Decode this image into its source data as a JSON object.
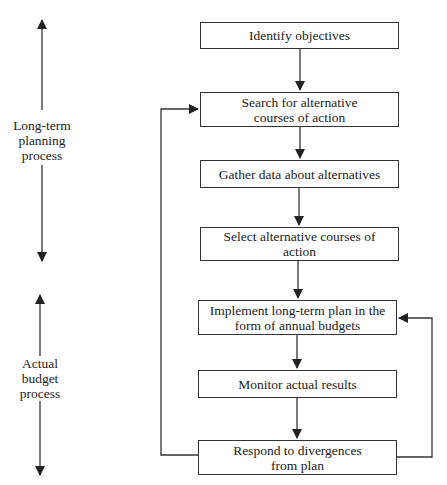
{
  "diagram": {
    "type": "flowchart",
    "side_labels": {
      "long_term": [
        "Long-term",
        "planning",
        "process"
      ],
      "actual_budget": [
        "Actual",
        "budget",
        "process"
      ]
    },
    "steps": [
      {
        "id": "identify",
        "text": "Identify objectives"
      },
      {
        "id": "search",
        "text": "Search for alternative courses of action"
      },
      {
        "id": "gather",
        "text": "Gather data about alternatives"
      },
      {
        "id": "select",
        "text": "Select alternative courses of action"
      },
      {
        "id": "implement",
        "text": "Implement long-term plan in the form of annual budgets"
      },
      {
        "id": "monitor",
        "text": "Monitor actual results"
      },
      {
        "id": "respond",
        "text": "Respond to divergences from plan"
      }
    ],
    "edges": [
      {
        "from": "identify",
        "to": "search"
      },
      {
        "from": "search",
        "to": "gather"
      },
      {
        "from": "gather",
        "to": "select"
      },
      {
        "from": "select",
        "to": "implement"
      },
      {
        "from": "implement",
        "to": "monitor"
      },
      {
        "from": "monitor",
        "to": "respond"
      },
      {
        "from": "respond",
        "to": "search",
        "route": "left-loop"
      },
      {
        "from": "respond",
        "to": "implement",
        "route": "right-loop"
      }
    ]
  }
}
